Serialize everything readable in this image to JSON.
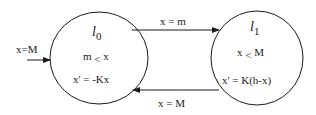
{
  "diagram": {
    "type": "hybrid-automaton",
    "initial": {
      "label": "x=M",
      "target": "l0"
    },
    "locations": [
      {
        "id": "l0",
        "name": "l",
        "subscript": "0",
        "invariant_left": "m",
        "invariant_op": "<",
        "invariant_right": "x",
        "flow": "x' = -Kx"
      },
      {
        "id": "l1",
        "name": "l",
        "subscript": "1",
        "invariant_left": "x",
        "invariant_op": "<",
        "invariant_right": "M",
        "flow": "x' = K(h-x)"
      }
    ],
    "transitions": [
      {
        "from": "l0",
        "to": "l1",
        "guard": "x = m"
      },
      {
        "from": "l1",
        "to": "l0",
        "guard": "x = M"
      }
    ],
    "colors": {
      "stroke": "#1a1a1a",
      "background": "#ffffff"
    }
  }
}
